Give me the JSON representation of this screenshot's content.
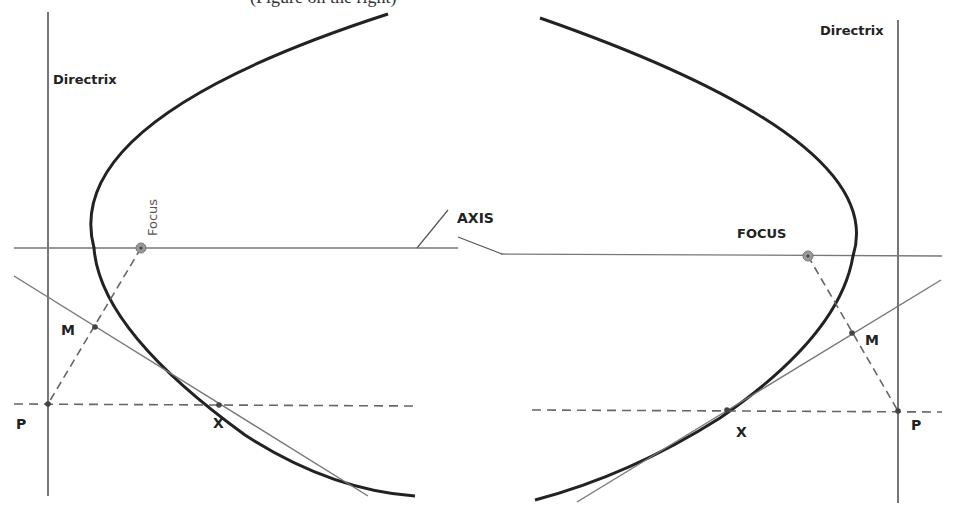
{
  "caption": "(Figure on the right)",
  "diagrams": [
    {
      "id": "left",
      "opening": "right",
      "labels": {
        "directrix": "Directrix",
        "focus": "Focus",
        "axis": "AXIS",
        "m": "M",
        "p": "P",
        "x": "X"
      }
    },
    {
      "id": "right",
      "opening": "left",
      "labels": {
        "directrix": "Directrix",
        "focus": "FOCUS",
        "m": "M",
        "p": "P",
        "x": "X"
      }
    }
  ],
  "colors": {
    "curve": "#222222",
    "line": "#777777",
    "dashed": "#666666",
    "point": "#555555",
    "focus_fill": "#888888"
  }
}
